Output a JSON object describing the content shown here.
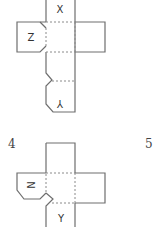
{
  "figures": [
    {
      "id": "net-top",
      "faces": {
        "top": "X",
        "left": "Z",
        "bottom": "Y"
      },
      "bottom_label_rotated": true
    },
    {
      "id": "net-4",
      "option_number": "4",
      "faces": {
        "left": "N",
        "bottom": "Y"
      }
    }
  ],
  "option_labels": [
    "4",
    "5"
  ]
}
